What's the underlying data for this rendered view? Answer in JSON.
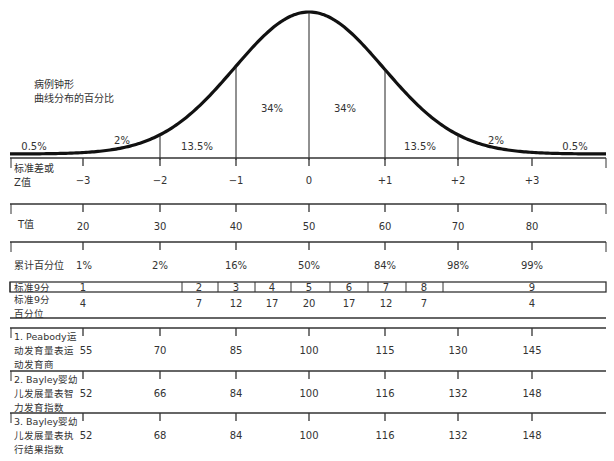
{
  "chart_data": {
    "type": "area",
    "title": "病例钟形曲线分布的百分比",
    "title_lines": [
      "病例钟形",
      "曲线分布的百分比"
    ],
    "curve": {
      "description": "Normal distribution bell curve divided at standard deviations",
      "segment_percentages": [
        {
          "range": "<-3",
          "label": "0.5%"
        },
        {
          "range": "-3 to -2",
          "label": "2%"
        },
        {
          "range": "-2 to -1",
          "label": "13.5%"
        },
        {
          "range": "-1 to 0",
          "label": "34%"
        },
        {
          "range": "0 to +1",
          "label": "34%"
        },
        {
          "range": "+1 to +2",
          "label": "13.5%"
        },
        {
          "range": "+2 to +3",
          "label": "2%"
        },
        {
          "range": ">+3",
          "label": "0.5%"
        }
      ]
    },
    "scales": [
      {
        "name": "z",
        "label_lines": [
          "标准差或",
          "Z值"
        ],
        "values": [
          "−3",
          "−2",
          "−1",
          "0",
          "+1",
          "+2",
          "+3"
        ]
      },
      {
        "name": "t",
        "label_lines": [
          "T值"
        ],
        "values": [
          "20",
          "30",
          "40",
          "50",
          "60",
          "70",
          "80"
        ]
      },
      {
        "name": "cumulative",
        "label_lines": [
          "累计百分位"
        ],
        "values": [
          "1%",
          "2%",
          "16%",
          "50%",
          "84%",
          "98%",
          "99%"
        ]
      },
      {
        "name": "peabody",
        "label_lines": [
          "1. Peabody运",
          "动发育量表运",
          "动发育商"
        ],
        "values": [
          "55",
          "70",
          "85",
          "100",
          "115",
          "130",
          "145"
        ]
      },
      {
        "name": "bayley_mdi",
        "label_lines": [
          "2. Bayley婴幼",
          "儿发展量表智",
          "力发育指数"
        ],
        "values": [
          "52",
          "66",
          "84",
          "100",
          "116",
          "132",
          "148"
        ]
      },
      {
        "name": "bayley_exec",
        "label_lines": [
          "3. Bayley婴幼",
          "儿发展量表执",
          "行结果指数"
        ],
        "values": [
          "52",
          "68",
          "84",
          "100",
          "116",
          "132",
          "148"
        ]
      }
    ],
    "stanine": {
      "row1_label": "标准9分",
      "row2_label_lines": [
        "标准9分",
        "百分位"
      ],
      "cells": [
        {
          "stanine": "1",
          "percent": "4"
        },
        {
          "stanine": "2",
          "percent": "7"
        },
        {
          "stanine": "3",
          "percent": "12"
        },
        {
          "stanine": "4",
          "percent": "17"
        },
        {
          "stanine": "5",
          "percent": "20"
        },
        {
          "stanine": "6",
          "percent": "17"
        },
        {
          "stanine": "7",
          "percent": "12"
        },
        {
          "stanine": "8",
          "percent": "7"
        },
        {
          "stanine": "9",
          "percent": "4"
        }
      ]
    },
    "xlabel": "",
    "ylabel": "",
    "grid": false,
    "legend": "none"
  }
}
